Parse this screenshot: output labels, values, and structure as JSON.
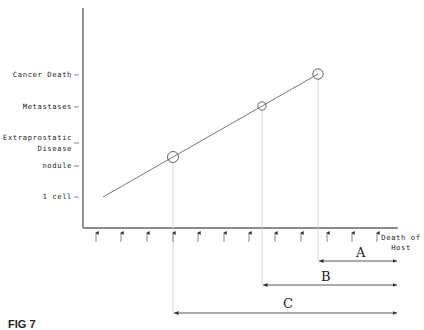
{
  "figure": {
    "caption": "FIG 7",
    "y_axis_labels": [
      {
        "id": "cancer-death",
        "text": "Cancer Death"
      },
      {
        "id": "metastases",
        "text": "Metastases"
      },
      {
        "id": "extraprostatic-1",
        "text": "Extraprostatic"
      },
      {
        "id": "extraprostatic-2",
        "text": "Disease"
      },
      {
        "id": "nodule",
        "text": "nodule"
      },
      {
        "id": "one-cell",
        "text": "1 cell"
      }
    ],
    "x_axis_end_label": [
      "Death of",
      "Host"
    ],
    "intervals": [
      {
        "label": "A",
        "from": "Cancer Death",
        "to": "Death of Host"
      },
      {
        "label": "B",
        "from": "Metastases",
        "to": "Death of Host"
      },
      {
        "label": "C",
        "from": "nodule",
        "to": "Death of Host"
      }
    ],
    "tick_arrow_count": 12,
    "marked_points": [
      "nodule",
      "Metastases",
      "Cancer Death"
    ],
    "colors": {
      "line": "#555555",
      "guide": "#cccccc",
      "text": "#222222"
    }
  }
}
